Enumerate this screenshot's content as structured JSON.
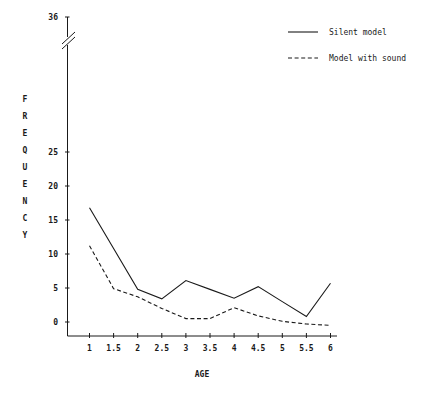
{
  "chart_data": {
    "type": "line",
    "title": "",
    "xlabel": "AGE",
    "ylabel": "FREQUENCY",
    "x": [
      1,
      1.5,
      2,
      2.5,
      3,
      3.5,
      4,
      4.5,
      5,
      5.5,
      6
    ],
    "xtick_labels": [
      "1",
      "1.5",
      "2",
      "2.5",
      "3",
      "3.5",
      "4",
      "4.5",
      "5",
      "5.5",
      "6"
    ],
    "ytick_labels": [
      "0",
      "5",
      "10",
      "15",
      "20",
      "25",
      "36"
    ],
    "ytick_values": [
      0,
      5,
      10,
      15,
      20,
      25,
      36
    ],
    "ylim": [
      -2,
      36
    ],
    "xlim": [
      0.75,
      6.25
    ],
    "grid": false,
    "axis_break": {
      "present": true,
      "between": [
        25,
        36
      ],
      "style": "double-slash"
    },
    "legend_position": "top-right",
    "series": [
      {
        "name": "Silent model",
        "style": "solid",
        "values": [
          16.8,
          10.8,
          4.8,
          3.4,
          6.1,
          4.8,
          3.5,
          5.2,
          3.0,
          0.8,
          5.7
        ]
      },
      {
        "name": "Model with sound",
        "style": "dashed",
        "values": [
          11.2,
          4.9,
          3.7,
          2.0,
          0.5,
          0.5,
          2.1,
          0.9,
          0.1,
          -0.3,
          -0.5
        ]
      }
    ]
  },
  "yaxis": {
    "label_letters": [
      "F",
      "R",
      "E",
      "Q",
      "U",
      "E",
      "N",
      "C",
      "Y"
    ]
  },
  "legend": {
    "entries": [
      {
        "label": "Silent model",
        "style": "solid"
      },
      {
        "label": "Model with sound",
        "style": "dashed"
      }
    ]
  }
}
